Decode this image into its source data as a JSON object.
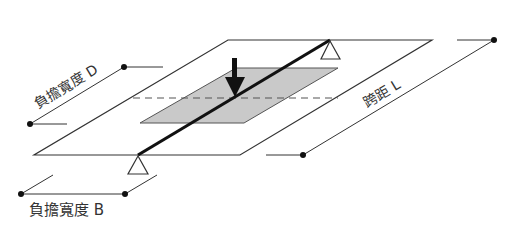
{
  "diagram": {
    "labels": {
      "width_d": "負擔寬度 D",
      "span_l": "跨距 L",
      "width_b": "負擔寬度 B"
    },
    "colors": {
      "line": "#333333",
      "beam": "#111111",
      "shaded_area": "#c9c9c9",
      "dashed": "#555555",
      "background": "#ffffff"
    },
    "elements": {
      "slab": "parallelogram-plate",
      "beam": "diagonal-beam",
      "load_area": "shaded-tributary-area",
      "load": "down-arrow-point-load",
      "supports": [
        "top-support-triangle",
        "bottom-support-triangle"
      ],
      "centerline": "dashed-line"
    }
  }
}
